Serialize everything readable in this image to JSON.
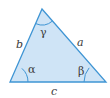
{
  "diagram": {
    "type": "triangle",
    "colors": {
      "fill": "#cfe4f6",
      "stroke": "#3f95d4",
      "text": "#3a3a3a"
    },
    "vertices": {
      "A": [
        10,
        82
      ],
      "B": [
        106,
        82
      ],
      "C": [
        42,
        9
      ]
    },
    "sides": {
      "a": "a",
      "b": "b",
      "c": "c"
    },
    "angles": {
      "alpha": "α",
      "beta": "β",
      "gamma": "γ"
    }
  }
}
